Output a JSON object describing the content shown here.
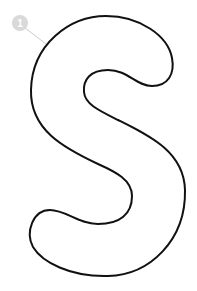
{
  "figure": {
    "letter": "S",
    "outline_color": "#111111",
    "fill_color": "#ffffff",
    "marker": {
      "number": "1",
      "circle_color": "#d9d9d9",
      "text_color": "#ffffff",
      "leader_color": "#cccccc"
    }
  }
}
